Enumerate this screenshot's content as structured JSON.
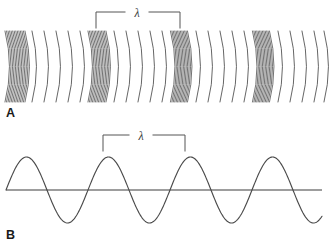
{
  "figure": {
    "background_color": "#ffffff",
    "width": 330,
    "height": 247,
    "ink_color": "#4a4a4a",
    "baseline_color": "#7d7d7d",
    "bracket_color": "#555555",
    "label_color": "#1a1a1a"
  },
  "panels": [
    {
      "id": "A",
      "label": "A",
      "label_x": 6,
      "label_y": 117,
      "wave_type": "longitudinal",
      "description": "Compression and rarefaction arcs",
      "arc_top": 31,
      "arc_bottom": 102,
      "arc_bow": 9,
      "bracket": {
        "label": "λ",
        "label_x": 137,
        "label_y": 17,
        "x_left": 96,
        "x_right": 180,
        "y_top": 12,
        "tick_bottom": 28
      },
      "compressions": [
        {
          "center": 15,
          "width": 20,
          "lines": 14
        },
        {
          "center": 97,
          "width": 18,
          "lines": 13
        },
        {
          "center": 179,
          "width": 17,
          "lines": 13
        },
        {
          "center": 261,
          "width": 17,
          "lines": 13
        }
      ],
      "rarefaction_arcs": [
        32,
        44,
        56,
        68,
        80,
        114,
        126,
        138,
        150,
        162,
        196,
        208,
        220,
        232,
        244,
        278,
        290,
        302,
        314,
        324
      ],
      "wavelength_px": 82
    },
    {
      "id": "B",
      "label": "B",
      "label_x": 6,
      "label_y": 239,
      "wave_type": "transverse",
      "description": "Sinusoidal wave with crests and troughs",
      "baseline_y": 190,
      "baseline_x_start": 6,
      "baseline_x_end": 322,
      "amplitude": 33,
      "wavelength_px": 82,
      "phase_start_x": 6,
      "cycles": 3.9,
      "bracket": {
        "label": "λ",
        "label_x": 141,
        "label_y": 140,
        "x_left": 103,
        "x_right": 185,
        "y_top": 135,
        "tick_bottom": 151
      }
    }
  ],
  "chart_data": {
    "type": "line",
    "xlabel": "",
    "ylabel": "",
    "annotations": [
      "λ",
      "λ",
      "A",
      "B"
    ],
    "series": [
      {
        "name": "Panel A compression centers (x px)",
        "values": [
          15,
          97,
          179,
          261
        ]
      },
      {
        "name": "Panel B crest positions (x px)",
        "values": [
          26,
          108,
          190,
          272
        ]
      },
      {
        "name": "Panel B trough positions (x px)",
        "values": [
          67,
          149,
          231,
          313
        ]
      }
    ],
    "wavelength_px": 82,
    "amplitude_px": 33,
    "baseline_y": 190,
    "grid": false,
    "legend": "none"
  }
}
